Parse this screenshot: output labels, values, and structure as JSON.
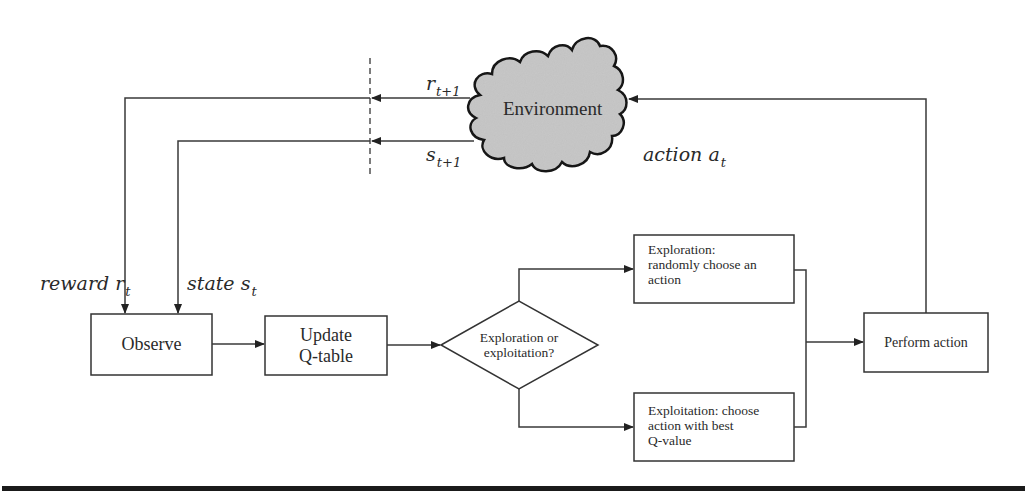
{
  "diagram": {
    "environment": {
      "label": "Environment",
      "fill": "#c8c8c8"
    },
    "signals": {
      "reward_next": {
        "var": "r",
        "sub": "t+1"
      },
      "state_next": {
        "var": "s",
        "sub": "t+1"
      },
      "action": {
        "prefix": "action ",
        "var": "a",
        "sub": "t"
      },
      "reward": {
        "prefix": "reward ",
        "var": "r",
        "sub": "t"
      },
      "state": {
        "prefix": "state ",
        "var": "s",
        "sub": "t"
      }
    },
    "nodes": {
      "observe": {
        "label": "Observe"
      },
      "update": {
        "line1": "Update",
        "line2": "Q-table"
      },
      "decision": {
        "line1": "Exploration or",
        "line2": "exploitation?"
      },
      "exploration": {
        "line1": "Exploration:",
        "line2": "randomly choose an",
        "line3": "action"
      },
      "exploitation": {
        "line1": "Exploitation: choose",
        "line2": "action with best",
        "line3": "Q-value"
      },
      "perform": {
        "label": "Perform action"
      }
    },
    "colors": {
      "line": "#3a3a3a",
      "text": "#2a2a2a",
      "rule": "#1a1a1a"
    }
  }
}
